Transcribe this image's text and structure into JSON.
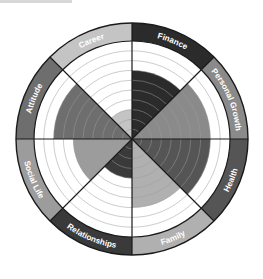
{
  "center": {
    "x": 132,
    "y": 139
  },
  "inner_radius": 98,
  "outer_radius": 116,
  "levels": 10,
  "colors": {
    "line": "#1a1a1a",
    "ring": "#9a9a9a",
    "background": "#ffffff"
  },
  "chart_data": {
    "type": "radial-bar",
    "scale": [
      0,
      10
    ],
    "categories": [
      "Finance",
      "Personal Growth",
      "Health",
      "Family",
      "Relationships",
      "Social Life",
      "Attitude",
      "Career"
    ],
    "values": [
      7,
      8,
      8,
      7,
      4,
      6,
      8,
      3
    ],
    "grid": true
  },
  "segments": [
    {
      "label": "Finance",
      "value": 7,
      "fill": "#2b2b2b",
      "band": "#2b2b2b",
      "text": "#ffffff"
    },
    {
      "label": "Personal Growth",
      "value": 8,
      "fill": "#8a8a8a",
      "band": "#8a8a8a",
      "text": "#ffffff"
    },
    {
      "label": "Health",
      "value": 8,
      "fill": "#555555",
      "band": "#555555",
      "text": "#ffffff"
    },
    {
      "label": "Family",
      "value": 7,
      "fill": "#b0b0b0",
      "band": "#b0b0b0",
      "text": "#ffffff"
    },
    {
      "label": "Relationships",
      "value": 4,
      "fill": "#3a3a3a",
      "band": "#3a3a3a",
      "text": "#ffffff"
    },
    {
      "label": "Social Life",
      "value": 6,
      "fill": "#9c9c9c",
      "band": "#9c9c9c",
      "text": "#ffffff"
    },
    {
      "label": "Attitude",
      "value": 8,
      "fill": "#6e6e6e",
      "band": "#6e6e6e",
      "text": "#ffffff"
    },
    {
      "label": "Career",
      "value": 3,
      "fill": "#c4c4c4",
      "band": "#c4c4c4",
      "text": "#ffffff"
    }
  ]
}
